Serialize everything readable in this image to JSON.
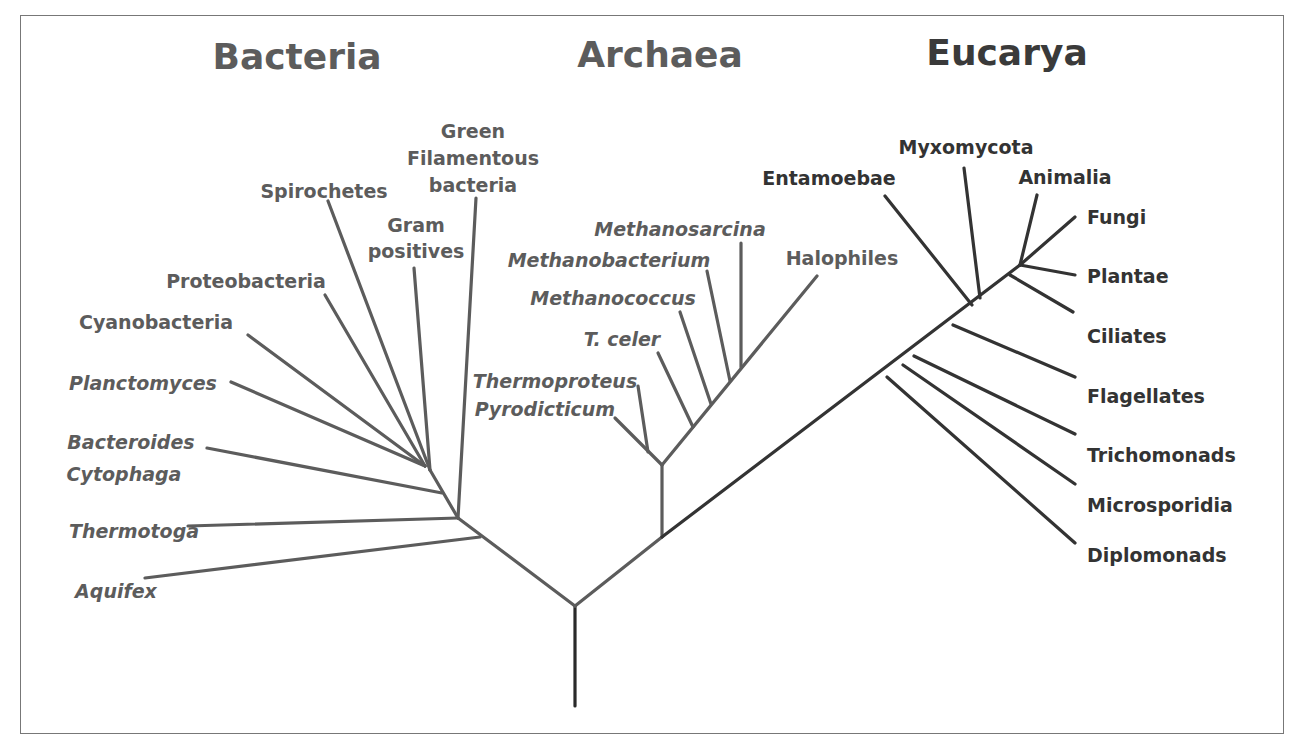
{
  "diagram": {
    "type": "phylogenetic-tree",
    "colors": {
      "bacteria": "#5c5c5c",
      "archaea": "#5c5c5c",
      "eucarya": "#333333",
      "root": "#2a2a2a",
      "frame": "#777777"
    },
    "domains": [
      {
        "id": "bacteria",
        "title": "Bacteria",
        "x": 297,
        "y": 69,
        "color": "#5c5c5c"
      },
      {
        "id": "archaea",
        "title": "Archaea",
        "x": 660,
        "y": 67,
        "color": "#5c5c5c"
      },
      {
        "id": "eucarya",
        "title": "Eucarya",
        "x": 1007,
        "y": 65,
        "color": "#3a3a3a"
      }
    ],
    "labels": [
      {
        "id": "green-filamentous-1",
        "text": "Green",
        "x": 473,
        "y": 138,
        "anchor": "middle",
        "italic": false,
        "group": "bacteria"
      },
      {
        "id": "green-filamentous-2",
        "text": "Filamentous",
        "x": 473,
        "y": 165,
        "anchor": "middle",
        "italic": false,
        "group": "bacteria"
      },
      {
        "id": "green-filamentous-3",
        "text": "bacteria",
        "x": 473,
        "y": 192,
        "anchor": "middle",
        "italic": false,
        "group": "bacteria"
      },
      {
        "id": "spirochetes",
        "text": "Spirochetes",
        "x": 324,
        "y": 198,
        "anchor": "middle",
        "italic": false,
        "group": "bacteria"
      },
      {
        "id": "gram-positives-1",
        "text": "Gram",
        "x": 416,
        "y": 232,
        "anchor": "middle",
        "italic": false,
        "group": "bacteria"
      },
      {
        "id": "gram-positives-2",
        "text": "positives",
        "x": 416,
        "y": 258,
        "anchor": "middle",
        "italic": false,
        "group": "bacteria"
      },
      {
        "id": "proteobacteria",
        "text": "Proteobacteria",
        "x": 246,
        "y": 288,
        "anchor": "middle",
        "italic": false,
        "group": "bacteria"
      },
      {
        "id": "cyanobacteria",
        "text": "Cyanobacteria",
        "x": 156,
        "y": 329,
        "anchor": "middle",
        "italic": false,
        "group": "bacteria"
      },
      {
        "id": "planctomyces",
        "text": "Planctomyces",
        "x": 143,
        "y": 390,
        "anchor": "middle",
        "italic": true,
        "group": "bacteria"
      },
      {
        "id": "bacteroides",
        "text": "Bacteroides",
        "x": 131,
        "y": 449,
        "anchor": "middle",
        "italic": true,
        "group": "bacteria"
      },
      {
        "id": "cytophaga",
        "text": "Cytophaga",
        "x": 124,
        "y": 481,
        "anchor": "middle",
        "italic": true,
        "group": "bacteria"
      },
      {
        "id": "thermotoga",
        "text": "Thermotoga",
        "x": 134,
        "y": 538,
        "anchor": "middle",
        "italic": true,
        "group": "bacteria"
      },
      {
        "id": "aquifex",
        "text": "Aquifex",
        "x": 116,
        "y": 598,
        "anchor": "middle",
        "italic": true,
        "group": "bacteria"
      },
      {
        "id": "methanosarcina",
        "text": "Methanosarcina",
        "x": 680,
        "y": 236,
        "anchor": "middle",
        "italic": true,
        "group": "archaea"
      },
      {
        "id": "methanobacterium",
        "text": "Methanobacterium",
        "x": 609,
        "y": 267,
        "anchor": "middle",
        "italic": true,
        "group": "archaea"
      },
      {
        "id": "halophiles",
        "text": "Halophiles",
        "x": 842,
        "y": 265,
        "anchor": "middle",
        "italic": false,
        "group": "archaea"
      },
      {
        "id": "methanococcus",
        "text": "Methanococcus",
        "x": 613,
        "y": 305,
        "anchor": "middle",
        "italic": true,
        "group": "archaea"
      },
      {
        "id": "t-celer",
        "text": "T. celer",
        "x": 622,
        "y": 346,
        "anchor": "middle",
        "italic": true,
        "group": "archaea"
      },
      {
        "id": "thermoproteus",
        "text": "Thermoproteus",
        "x": 555,
        "y": 388,
        "anchor": "middle",
        "italic": true,
        "group": "archaea"
      },
      {
        "id": "pyrodicticum",
        "text": "Pyrodicticum",
        "x": 545,
        "y": 416,
        "anchor": "middle",
        "italic": true,
        "group": "archaea"
      },
      {
        "id": "myxomycota",
        "text": "Myxomycota",
        "x": 966,
        "y": 154,
        "anchor": "middle",
        "italic": false,
        "group": "eucarya"
      },
      {
        "id": "entamoebae",
        "text": "Entamoebae",
        "x": 829,
        "y": 185,
        "anchor": "middle",
        "italic": false,
        "group": "eucarya"
      },
      {
        "id": "animalia",
        "text": "Animalia",
        "x": 1065,
        "y": 184,
        "anchor": "middle",
        "italic": false,
        "group": "eucarya"
      },
      {
        "id": "fungi",
        "text": "Fungi",
        "x": 1087,
        "y": 224,
        "anchor": "start",
        "italic": false,
        "group": "eucarya"
      },
      {
        "id": "plantae",
        "text": "Plantae",
        "x": 1087,
        "y": 283,
        "anchor": "start",
        "italic": false,
        "group": "eucarya"
      },
      {
        "id": "ciliates",
        "text": "Ciliates",
        "x": 1087,
        "y": 343,
        "anchor": "start",
        "italic": false,
        "group": "eucarya"
      },
      {
        "id": "flagellates",
        "text": "Flagellates",
        "x": 1087,
        "y": 403,
        "anchor": "start",
        "italic": false,
        "group": "eucarya"
      },
      {
        "id": "trichomonads",
        "text": "Trichomonads",
        "x": 1087,
        "y": 462,
        "anchor": "start",
        "italic": false,
        "group": "eucarya"
      },
      {
        "id": "microsporidia",
        "text": "Microsporidia",
        "x": 1087,
        "y": 512,
        "anchor": "start",
        "italic": false,
        "group": "eucarya"
      },
      {
        "id": "diplomonads",
        "text": "Diplomonads",
        "x": 1087,
        "y": 562,
        "anchor": "start",
        "italic": false,
        "group": "eucarya"
      }
    ],
    "branches": [
      {
        "id": "trunk",
        "group": "root",
        "x1": 575,
        "y1": 606,
        "x2": 575,
        "y2": 706
      },
      {
        "id": "bacteria-stem",
        "group": "bacteria",
        "x1": 575,
        "y1": 606,
        "x2": 458,
        "y2": 518
      },
      {
        "id": "aquifex",
        "group": "bacteria",
        "x1": 480,
        "y1": 537,
        "x2": 145,
        "y2": 578
      },
      {
        "id": "thermotoga",
        "group": "bacteria",
        "x1": 458,
        "y1": 518,
        "x2": 188,
        "y2": 526
      },
      {
        "id": "green-filamentous",
        "group": "bacteria",
        "x1": 458,
        "y1": 518,
        "x2": 476,
        "y2": 198
      },
      {
        "id": "bacteria-inner",
        "group": "bacteria",
        "x1": 458,
        "y1": 518,
        "x2": 430,
        "y2": 470
      },
      {
        "id": "bacteroides",
        "group": "bacteria",
        "x1": 442,
        "y1": 493,
        "x2": 207,
        "y2": 448
      },
      {
        "id": "gram-positives",
        "group": "bacteria",
        "x1": 430,
        "y1": 470,
        "x2": 414,
        "y2": 268
      },
      {
        "id": "spirochetes",
        "group": "bacteria",
        "x1": 430,
        "y1": 470,
        "x2": 328,
        "y2": 201
      },
      {
        "id": "proteobacteria",
        "group": "bacteria",
        "x1": 425,
        "y1": 466,
        "x2": 325,
        "y2": 295
      },
      {
        "id": "cyanobacteria",
        "group": "bacteria",
        "x1": 425,
        "y1": 466,
        "x2": 248,
        "y2": 335
      },
      {
        "id": "planctomyces",
        "group": "bacteria",
        "x1": 425,
        "y1": 466,
        "x2": 231,
        "y2": 382
      },
      {
        "id": "euk-arch-stem",
        "group": "archaea",
        "x1": 575,
        "y1": 606,
        "x2": 662,
        "y2": 537
      },
      {
        "id": "archaea-vertical",
        "group": "archaea",
        "x1": 662,
        "y1": 537,
        "x2": 662,
        "y2": 465
      },
      {
        "id": "pyrodicticum",
        "group": "archaea",
        "x1": 662,
        "y1": 465,
        "x2": 615,
        "y2": 418
      },
      {
        "id": "thermoproteus",
        "group": "archaea",
        "x1": 648,
        "y1": 452,
        "x2": 638,
        "y2": 386
      },
      {
        "id": "archaea-main",
        "group": "archaea",
        "x1": 662,
        "y1": 465,
        "x2": 817,
        "y2": 276
      },
      {
        "id": "t-celer",
        "group": "archaea",
        "x1": 693,
        "y1": 427,
        "x2": 658,
        "y2": 353
      },
      {
        "id": "methanococcus",
        "group": "archaea",
        "x1": 711,
        "y1": 404,
        "x2": 680,
        "y2": 312
      },
      {
        "id": "methanobacterium",
        "group": "archaea",
        "x1": 730,
        "y1": 381,
        "x2": 707,
        "y2": 271
      },
      {
        "id": "methanosarcina",
        "group": "archaea",
        "x1": 741,
        "y1": 367,
        "x2": 741,
        "y2": 243
      },
      {
        "id": "eucarya-main",
        "group": "eucarya",
        "x1": 662,
        "y1": 537,
        "x2": 1020,
        "y2": 265
      },
      {
        "id": "diplomonads",
        "group": "eucarya",
        "x1": 887,
        "y1": 377,
        "x2": 1075,
        "y2": 543
      },
      {
        "id": "microsporidia",
        "group": "eucarya",
        "x1": 903,
        "y1": 365,
        "x2": 1075,
        "y2": 484
      },
      {
        "id": "trichomonads",
        "group": "eucarya",
        "x1": 914,
        "y1": 356,
        "x2": 1075,
        "y2": 434
      },
      {
        "id": "flagellates",
        "group": "eucarya",
        "x1": 953,
        "y1": 325,
        "x2": 1075,
        "y2": 377
      },
      {
        "id": "entamoebae",
        "group": "eucarya",
        "x1": 972,
        "y1": 305,
        "x2": 885,
        "y2": 196
      },
      {
        "id": "myxomycota",
        "group": "eucarya",
        "x1": 980,
        "y1": 298,
        "x2": 964,
        "y2": 168
      },
      {
        "id": "ciliates",
        "group": "eucarya",
        "x1": 1010,
        "y1": 275,
        "x2": 1073,
        "y2": 312
      },
      {
        "id": "plantae",
        "group": "eucarya",
        "x1": 1020,
        "y1": 265,
        "x2": 1075,
        "y2": 275
      },
      {
        "id": "fungi",
        "group": "eucarya",
        "x1": 1020,
        "y1": 265,
        "x2": 1075,
        "y2": 217
      },
      {
        "id": "animalia",
        "group": "eucarya",
        "x1": 1020,
        "y1": 265,
        "x2": 1037,
        "y2": 195
      }
    ]
  }
}
